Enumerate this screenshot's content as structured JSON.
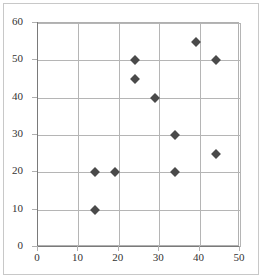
{
  "chart_data": {
    "type": "scatter",
    "title": "",
    "subtitle": "",
    "xlabel": "",
    "ylabel": "",
    "xlim": [
      0,
      50
    ],
    "ylim": [
      0,
      60
    ],
    "xticks": [
      0,
      10,
      20,
      30,
      40,
      50
    ],
    "yticks": [
      0,
      10,
      20,
      30,
      40,
      50,
      60
    ],
    "xtick_labels": [
      "0",
      "10",
      "20",
      "30",
      "40",
      "50"
    ],
    "ytick_labels": [
      "0",
      "10",
      "20",
      "30",
      "40",
      "50",
      "60"
    ],
    "grid": true,
    "grid_axis": "both",
    "legend": false,
    "legend_position": "none",
    "marker": "diamond",
    "marker_color": "#4a4a4a",
    "grid_color": "#b5b5b5",
    "axis_color": "#7a7a7a",
    "background_color": "#ffffff",
    "border_color": "#c8c8c8",
    "series": [
      {
        "name": "series-1",
        "points": [
          {
            "x": 14,
            "y": 10
          },
          {
            "x": 14,
            "y": 20
          },
          {
            "x": 19,
            "y": 20
          },
          {
            "x": 24,
            "y": 45
          },
          {
            "x": 24,
            "y": 50
          },
          {
            "x": 29,
            "y": 40
          },
          {
            "x": 34,
            "y": 20
          },
          {
            "x": 34,
            "y": 30
          },
          {
            "x": 39,
            "y": 55
          },
          {
            "x": 44,
            "y": 25
          },
          {
            "x": 44,
            "y": 50
          }
        ]
      }
    ]
  }
}
